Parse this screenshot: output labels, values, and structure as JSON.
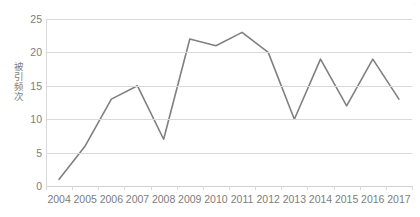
{
  "top_strip": {
    "text": "·"
  },
  "axis": {
    "y_title": "被引频次",
    "y_ticks": [
      "0",
      "5",
      "10",
      "15",
      "20",
      "25"
    ],
    "x_labels": [
      "2004",
      "2005",
      "2006",
      "2007",
      "2008",
      "2009",
      "2010",
      "2011",
      "2012",
      "2013",
      "2014",
      "2015",
      "2016",
      "2017"
    ]
  },
  "style": {
    "line_color": "#808080",
    "grid_color": "#d9d9d9",
    "text_color": "#7d7d7d",
    "background": "#ffffff"
  },
  "chart_data": {
    "type": "line",
    "title": "",
    "subtitle": "",
    "xlabel": "",
    "ylabel": "被引频次",
    "categories": [
      "2004",
      "2005",
      "2006",
      "2007",
      "2008",
      "2009",
      "2010",
      "2011",
      "2012",
      "2013",
      "2014",
      "2015",
      "2016",
      "2017"
    ],
    "values": [
      1,
      6,
      13,
      15,
      7,
      22,
      21,
      23,
      20,
      10,
      19,
      12,
      19,
      13
    ],
    "series": [
      {
        "name": "被引频次",
        "values": [
          1,
          6,
          13,
          15,
          7,
          22,
          21,
          23,
          20,
          10,
          19,
          12,
          19,
          13
        ],
        "color": "#808080"
      }
    ],
    "ylim": [
      0,
      25
    ],
    "y_tick_step": 5,
    "y_ticks": [
      0,
      5,
      10,
      15,
      20,
      25
    ],
    "grid": {
      "horizontal": true,
      "vertical": false
    },
    "legend": {
      "visible": false,
      "position": "none"
    },
    "markers": false,
    "line_width": 1.6
  }
}
